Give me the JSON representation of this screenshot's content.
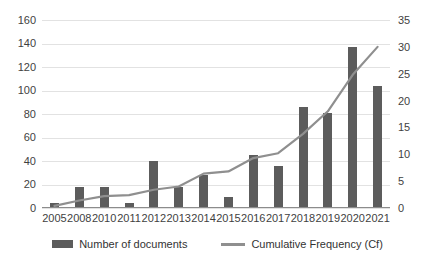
{
  "chart_data": {
    "type": "bar",
    "title": "",
    "subtitle": "",
    "xlabel": "",
    "ylabel": "",
    "categories": [
      "2005",
      "2008",
      "2010",
      "2011",
      "2012",
      "2013",
      "2014",
      "2015",
      "2016",
      "2017",
      "2018",
      "2019",
      "2020",
      "2021"
    ],
    "series": [
      {
        "name": "Number of documents",
        "type": "bar",
        "axis": "left",
        "color": "#5c5c5c",
        "values": [
          4,
          18,
          18,
          4,
          40,
          18,
          28,
          9,
          45,
          36,
          86,
          81,
          137,
          104
        ]
      },
      {
        "name": "Cumulative Frequency (Cf)",
        "type": "line",
        "axis": "right",
        "color": "#8f8f8f",
        "values": [
          0.4,
          1.4,
          2.2,
          2.4,
          3.4,
          4.0,
          6.4,
          6.8,
          9.3,
          10.2,
          13.8,
          18.0,
          24.8,
          30.0
        ]
      }
    ],
    "left_axis": {
      "ticks": [
        "0",
        "20",
        "40",
        "60",
        "80",
        "100",
        "120",
        "140",
        "160"
      ],
      "min": 0,
      "max": 160,
      "step": 20
    },
    "right_axis": {
      "ticks": [
        "0",
        "5",
        "10",
        "15",
        "20",
        "25",
        "30",
        "35"
      ],
      "min": 0,
      "max": 35,
      "step": 5
    },
    "grid": true,
    "legend_position": "bottom",
    "legend": [
      "Number of documents",
      "Cumulative Frequency (Cf)"
    ]
  }
}
